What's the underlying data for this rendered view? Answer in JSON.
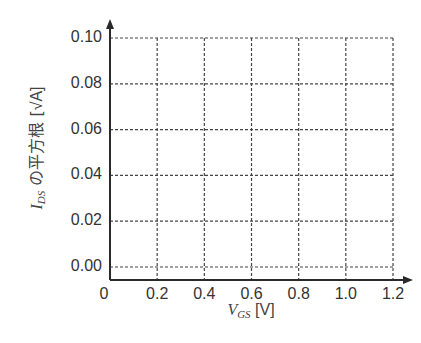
{
  "chart_data": {
    "type": "line",
    "title": "",
    "xlabel": "V_GS [V]",
    "ylabel": "I_DS の平方根 [√A]",
    "x_ticks": [
      "0",
      "0.2",
      "0.4",
      "0.6",
      "0.8",
      "1.0",
      "1.2"
    ],
    "y_ticks": [
      "0.00",
      "0.02",
      "0.04",
      "0.06",
      "0.08",
      "0.10"
    ],
    "xlim": [
      0,
      1.2
    ],
    "ylim": [
      0,
      0.1
    ],
    "grid": true,
    "grid_style": "dashed",
    "series": [],
    "legend": null,
    "note": "Empty grid / blank plot template with arrowed axes"
  },
  "labels": {
    "x_var": "V",
    "x_sub": "GS",
    "x_unit": " [V]",
    "y_var": "I",
    "y_sub": "DS",
    "y_text": " の平方根 [",
    "y_unit": "√A",
    "y_close": "]"
  },
  "colors": {
    "axis": "#2a2a2a",
    "grid": "#444444",
    "text": "#333333"
  }
}
